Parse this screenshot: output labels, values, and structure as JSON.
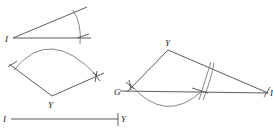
{
  "figures": {
    "angle": {
      "vertex_label": "I"
    },
    "arc_angle": {
      "vertex_label": "Y"
    },
    "segment": {
      "start_label": "I",
      "end_label": "Y"
    },
    "triangle": {
      "top_label": "Y",
      "left_label": "G",
      "right_label": "I"
    }
  }
}
